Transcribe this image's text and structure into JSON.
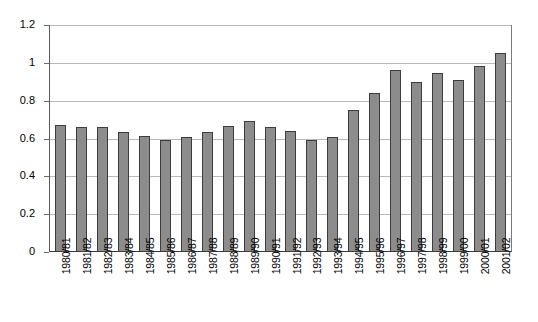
{
  "chart_data": {
    "type": "bar",
    "title": "",
    "subtitle": "",
    "xlabel": "",
    "ylabel": "",
    "ylim": [
      0,
      1.2
    ],
    "yticks": [
      "0",
      "0.2",
      "0.4",
      "0.6",
      "0.8",
      "1",
      "1.2"
    ],
    "ytick_values": [
      0,
      0.2,
      0.4,
      0.6,
      0.8,
      1.0,
      1.2
    ],
    "grid": true,
    "legend": null,
    "legend_position": "none",
    "bar_color": "#8c8c8c",
    "bar_border_color": "#3d3d3d",
    "gridline_color": "#b9b9b9",
    "axis_color": "#3a3a3a",
    "background": "#ffffff",
    "categories": [
      "1980/81",
      "1981/82",
      "1982/83",
      "1983/84",
      "1984/85",
      "1985/86",
      "1986/87",
      "1987/88",
      "1988/89",
      "1989/90",
      "1990/91",
      "1991/92",
      "1992/93",
      "1993/94",
      "1994/95",
      "1995/96",
      "1996/97",
      "1997/98",
      "1998/99",
      "1999/00",
      "2000/01",
      "2001/02"
    ],
    "values": [
      0.675,
      0.665,
      0.665,
      0.635,
      0.615,
      0.597,
      0.612,
      0.638,
      0.668,
      0.697,
      0.665,
      0.645,
      0.595,
      0.61,
      0.753,
      0.845,
      0.965,
      0.903,
      0.948,
      0.915,
      0.99,
      1.057
    ],
    "annotations": []
  }
}
